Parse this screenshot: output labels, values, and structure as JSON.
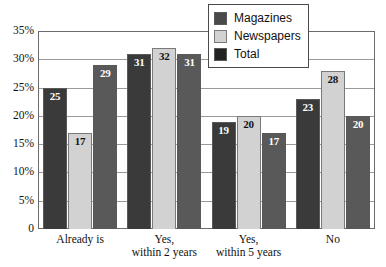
{
  "chart_data": {
    "type": "bar",
    "title": "",
    "subtitle": "",
    "xlabel": "",
    "ylabel": "",
    "ylim": [
      0,
      35
    ],
    "grid": true,
    "legend_position": "top-right",
    "categories": [
      "Already is",
      "Yes, within 2 years",
      "Yes, within 5 years",
      "No"
    ],
    "category_lines": [
      {
        "line1": "Already is",
        "line2": ""
      },
      {
        "line1": "Yes,",
        "line2": "within 2 years"
      },
      {
        "line1": "Yes,",
        "line2": "within 5 years"
      },
      {
        "line1": "No",
        "line2": ""
      }
    ],
    "ytick_labels": [
      "35%",
      "30%",
      "25%",
      "20%",
      "15%",
      "10%",
      "5%",
      "0"
    ],
    "ytick_values": [
      35,
      30,
      25,
      20,
      15,
      10,
      5,
      0
    ],
    "series": [
      {
        "name": "Magazines",
        "color": "#3a3a3a",
        "values": [
          25,
          31,
          19,
          23
        ]
      },
      {
        "name": "Newspapers",
        "color": "#d2d2d2",
        "values": [
          17,
          32,
          20,
          28
        ]
      },
      {
        "name": "Total",
        "color": "#595959",
        "values": [
          29,
          31,
          17,
          20
        ]
      }
    ]
  },
  "legend": {
    "items": [
      {
        "label": "Magazines",
        "swatch_class": "sw-magazines"
      },
      {
        "label": "Newspapers",
        "swatch_class": "sw-newspapers"
      },
      {
        "label": "Total",
        "swatch_class": "sw-total"
      }
    ]
  }
}
